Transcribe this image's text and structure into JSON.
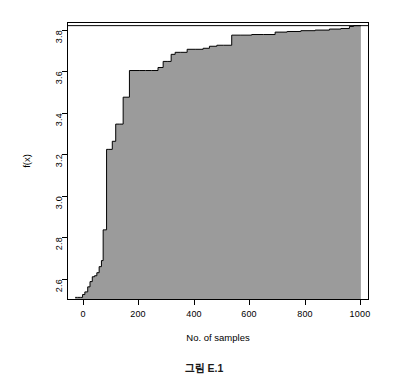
{
  "figure": {
    "caption": "그림 E.1",
    "background_color": "#ffffff"
  },
  "axes": {
    "x_title": "No. of samples",
    "y_title": "f(x)",
    "x_tick_labels": [
      "0",
      "200",
      "400",
      "600",
      "800",
      "1000"
    ],
    "y_tick_labels": [
      "2.6",
      "2.8",
      "3.0",
      "3.2",
      "3.4",
      "3.6",
      "3.8"
    ]
  },
  "chart_data": {
    "type": "area",
    "title": "그림 E.1",
    "xlabel": "No. of samples",
    "ylabel": "f(x)",
    "xlim": [
      -25,
      1025
    ],
    "ylim": [
      2.47,
      3.835
    ],
    "grid": false,
    "legend": "none",
    "fill_color": "#9b9b9b",
    "line_color": "#000000",
    "box_color": "#000000",
    "reference_line_y": 3.822,
    "xticks": [
      0,
      200,
      400,
      600,
      800,
      1000
    ],
    "yticks": [
      2.6,
      2.8,
      3.0,
      3.2,
      3.4,
      3.6,
      3.8
    ],
    "x": [
      0,
      8,
      18,
      26,
      34,
      44,
      52,
      60,
      68,
      76,
      84,
      92,
      98,
      104,
      110,
      118,
      130,
      142,
      156,
      168,
      178,
      190,
      206,
      224,
      246,
      268,
      290,
      308,
      322,
      336,
      350,
      368,
      392,
      420,
      448,
      470,
      496,
      520,
      548,
      580,
      618,
      660,
      700,
      742,
      790,
      840,
      890,
      930,
      960,
      975,
      1000
    ],
    "y": [
      2.478,
      2.478,
      2.478,
      2.492,
      2.505,
      2.53,
      2.556,
      2.58,
      2.585,
      2.6,
      2.63,
      2.66,
      2.812,
      2.812,
      3.21,
      3.21,
      3.25,
      3.335,
      3.335,
      3.468,
      3.468,
      3.6,
      3.6,
      3.6,
      3.6,
      3.6,
      3.615,
      3.645,
      3.645,
      3.68,
      3.69,
      3.69,
      3.705,
      3.705,
      3.71,
      3.72,
      3.725,
      3.725,
      3.775,
      3.775,
      3.778,
      3.778,
      3.79,
      3.793,
      3.797,
      3.8,
      3.805,
      3.808,
      3.818,
      3.822,
      3.822
    ]
  }
}
